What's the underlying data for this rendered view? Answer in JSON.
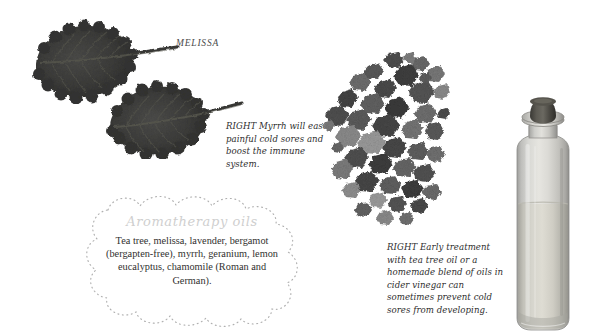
{
  "page": {
    "background_color": "#ffffff",
    "width": 600,
    "height": 331,
    "kind": "book-page-spread"
  },
  "labels": {
    "melissa": "MELISSA"
  },
  "captions": {
    "myrrh": {
      "lead": "RIGHT",
      "text": "Myrrh will ease painful cold sores and boost the immune system."
    },
    "tea_tree": {
      "lead": "RIGHT",
      "text": "Early treatment with tea tree oil or a homemade blend of oils in cider vinegar can sometimes prevent cold sores from developing."
    }
  },
  "aromatherapy_panel": {
    "title": "Aromatherapy oils",
    "body": "Tea tree, melissa, lavender, bergamot (bergapten-free), myrrh, geranium, lemon eucalyptus, chamomile (Roman and German).",
    "title_color": "#cfcfcf",
    "body_color": "#31312f",
    "border_style": "dotted-scalloped-cartouche",
    "border_color": "#b8b8b8"
  },
  "images": {
    "leaf_upper": {
      "name": "melissa-leaf-upper",
      "color": "#3b3b3b"
    },
    "leaf_lower": {
      "name": "melissa-leaf-lower",
      "color": "#3b3b3b"
    },
    "myrrh_resin": {
      "name": "myrrh-resin-cluster",
      "color": "#5a5a5a"
    },
    "bottle": {
      "name": "oil-bottle",
      "glass_color": "#c9c9c7",
      "liquid_color": "#cdcbc4",
      "stopper_color": "#4d4b47"
    }
  }
}
